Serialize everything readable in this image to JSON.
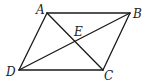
{
  "figure": {
    "type": "parallelogram-with-diagonals",
    "points": {
      "A": {
        "label": "A",
        "x": 47,
        "y": 13,
        "lx": 36,
        "ly": 14
      },
      "B": {
        "label": "B",
        "x": 130,
        "y": 13,
        "lx": 133,
        "ly": 18
      },
      "C": {
        "label": "C",
        "x": 103,
        "y": 70,
        "lx": 104,
        "ly": 80
      },
      "D": {
        "label": "D",
        "x": 19,
        "y": 70,
        "lx": 6,
        "ly": 76
      },
      "E": {
        "label": "E",
        "x": 74,
        "y": 42,
        "lx": 74,
        "ly": 36
      }
    },
    "segments": [
      [
        "A",
        "B"
      ],
      [
        "B",
        "C"
      ],
      [
        "C",
        "D"
      ],
      [
        "D",
        "A"
      ],
      [
        "A",
        "C"
      ],
      [
        "B",
        "D"
      ]
    ],
    "colors": {
      "stroke": "#1a1a1a",
      "label": "#222222",
      "background": "#ffffff"
    }
  }
}
